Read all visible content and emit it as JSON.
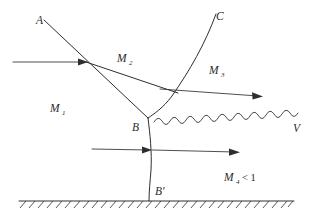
{
  "figure": {
    "kind": "shock-reflection-diagram",
    "background_color": "#ffffff",
    "ink_color": "#2e2e2e",
    "width": 311,
    "height": 220
  },
  "labels": {
    "incident_shock": "A",
    "reflected_shock": "C",
    "triple_point": "B",
    "foot_point": "B′",
    "slip_line": "V",
    "region_1": {
      "symbol": "M",
      "subscript": "1"
    },
    "region_2": {
      "symbol": "M",
      "subscript": "2"
    },
    "region_3": {
      "symbol": "M",
      "subscript": "3"
    },
    "region_4": {
      "symbol": "M",
      "subscript": "4",
      "relation": "< 1"
    }
  },
  "elements": {
    "incident_arrow_label": "upstream-flow-arrow",
    "region3_arrow_label": "region-3-flow-arrow",
    "region4_arrow_label": "region-4-flow-arrow",
    "ground_label": "hatched-wall",
    "slip_line_label": "wavy-slip-line",
    "mach_stem_label": "mach-stem-shock",
    "reflected_label": "reflected-shock-curve",
    "incident_label": "incident-shock-line",
    "triple_branch_label": "triple-point-branch"
  }
}
